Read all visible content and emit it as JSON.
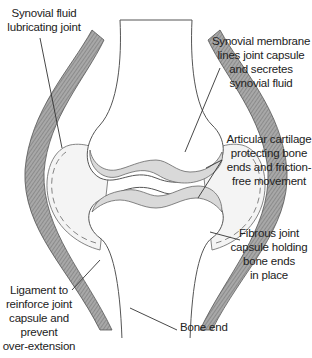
{
  "diagram": {
    "type": "anatomical-diagram",
    "colors": {
      "ligament": "#8a8a8a",
      "ligament_stripe": "#bdbdbd",
      "bone_fill": "#ffffff",
      "bone_outline": "#555555",
      "cartilage": "#d9d9d9",
      "fluid": "#f2f2f2",
      "leader_line": "#333333",
      "text": "#222222"
    },
    "labels": [
      {
        "id": "synovial-fluid",
        "text": "Synovial fluid\nlubricating joint"
      },
      {
        "id": "synovial-membrane",
        "text": "Synovial membrane\nlines joint capsule\nand secretes\nsynovial fluid"
      },
      {
        "id": "articular-cartilage",
        "text": "Articular cartilage\nprotecting bone\nends and friction-\nfree movement"
      },
      {
        "id": "fibrous-capsule",
        "text": "Fibrous joint\ncapsule holding\nbone ends\nin place"
      },
      {
        "id": "ligament",
        "text": "Ligament to\nreinforce joint\ncapsule and\nprevent\nover-extension"
      },
      {
        "id": "bone-end",
        "text": "Bone end"
      }
    ]
  }
}
